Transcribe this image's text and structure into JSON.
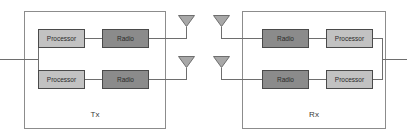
{
  "diagram": {
    "type": "block-diagram",
    "background_color": "#ffffff",
    "colors": {
      "enclosure_stroke": "#8c8c8c",
      "wire": "#6e6e6e",
      "processor_fill": "#c2c2c2",
      "radio_fill": "#8b8b8b",
      "block_stroke": "#4a4a4a",
      "antenna_fill": "#a8a8a8",
      "text": "#2a2a2a"
    }
  },
  "transmitter": {
    "label": "Tx",
    "enclosure": {
      "x": 24,
      "y": 11,
      "width": 141,
      "height": 117
    },
    "chains": [
      {
        "index": 1,
        "blocks": [
          {
            "label": "Processor",
            "kind": "processor",
            "x": 38,
            "y": 29,
            "width": 46,
            "height": 18
          },
          {
            "label": "Radio",
            "kind": "radio",
            "x": 102,
            "y": 29,
            "width": 46,
            "height": 18
          }
        ],
        "antenna": {
          "name": "antenna",
          "tip_x": 186,
          "tip_y": 26,
          "half_width": 8,
          "height": 11,
          "stem_bottom_y": 38
        }
      },
      {
        "index": 2,
        "blocks": [
          {
            "label": "Processor",
            "kind": "processor",
            "x": 38,
            "y": 70,
            "width": 46,
            "height": 18
          },
          {
            "label": "Radio",
            "kind": "radio",
            "x": 102,
            "y": 70,
            "width": 46,
            "height": 18
          }
        ],
        "antenna": {
          "name": "antenna",
          "tip_x": 186,
          "tip_y": 67,
          "half_width": 8,
          "height": 11,
          "stem_bottom_y": 79
        }
      }
    ],
    "input_port": {
      "x": 0,
      "y": 59
    }
  },
  "receiver": {
    "label": "Rx",
    "enclosure": {
      "x": 242,
      "y": 11,
      "width": 143,
      "height": 117
    },
    "chains": [
      {
        "index": 1,
        "blocks": [
          {
            "label": "Radio",
            "kind": "radio",
            "x": 262,
            "y": 29,
            "width": 46,
            "height": 18
          },
          {
            "label": "Processor",
            "kind": "processor",
            "x": 326,
            "y": 29,
            "width": 46,
            "height": 18
          }
        ],
        "antenna": {
          "name": "antenna",
          "tip_x": 221,
          "tip_y": 26,
          "half_width": 8,
          "height": 11,
          "stem_bottom_y": 38
        }
      },
      {
        "index": 2,
        "blocks": [
          {
            "label": "Radio",
            "kind": "radio",
            "x": 262,
            "y": 70,
            "width": 46,
            "height": 18
          },
          {
            "label": "Processor",
            "kind": "processor",
            "x": 326,
            "y": 70,
            "width": 46,
            "height": 18
          }
        ],
        "antenna": {
          "name": "antenna",
          "tip_x": 221,
          "tip_y": 67,
          "half_width": 8,
          "height": 11,
          "stem_bottom_y": 79
        }
      }
    ],
    "output_port": {
      "x": 407,
      "y": 59
    }
  },
  "labels": {
    "processor": "Processor",
    "radio": "Radio",
    "tx": "Tx",
    "rx": "Rx"
  }
}
